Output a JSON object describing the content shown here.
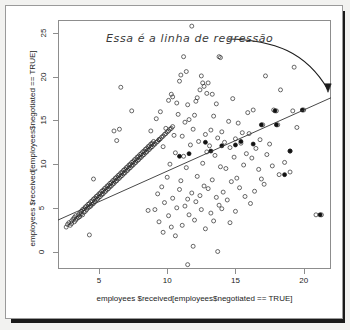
{
  "figure": {
    "annotation": "Essa é a linha de regressão",
    "background": "#ffffff",
    "frame_color": "#8d8d8d"
  },
  "chart_data": {
    "type": "scatter",
    "title": "",
    "xlabel": "employees $received[employees$negotiated == TRUE]",
    "ylabel": "employees $received[employees$negotiated == TRUE]",
    "xlim": [
      2.0,
      22.0
    ],
    "ylim": [
      -2.0,
      26.5
    ],
    "xticks": [
      5,
      10,
      15,
      20
    ],
    "yticks": [
      0,
      5,
      10,
      15,
      20,
      25
    ],
    "grid": false,
    "legend": null,
    "marker": "open-circle",
    "regression_line": {
      "label": "Essa é a linha de regressão",
      "x_start": 2.0,
      "y_start": 3.6,
      "x_end": 22.0,
      "y_end": 17.6,
      "slope": 0.7,
      "intercept": 2.2,
      "color": "#333333"
    },
    "points": [
      [
        2.6,
        2.8
      ],
      [
        2.7,
        3.1
      ],
      [
        2.8,
        3.3
      ],
      [
        2.9,
        3.0
      ],
      [
        3.0,
        3.5
      ],
      [
        3.0,
        3.2
      ],
      [
        3.1,
        3.7
      ],
      [
        3.2,
        3.4
      ],
      [
        3.2,
        3.9
      ],
      [
        3.3,
        3.6
      ],
      [
        3.3,
        4.1
      ],
      [
        3.4,
        3.8
      ],
      [
        3.5,
        4.2
      ],
      [
        3.5,
        3.9
      ],
      [
        3.6,
        4.4
      ],
      [
        3.6,
        4.0
      ],
      [
        3.7,
        4.3
      ],
      [
        3.7,
        4.6
      ],
      [
        3.8,
        4.2
      ],
      [
        3.8,
        4.8
      ],
      [
        3.9,
        4.5
      ],
      [
        3.9,
        4.9
      ],
      [
        4.0,
        4.6
      ],
      [
        4.0,
        5.1
      ],
      [
        4.1,
        4.8
      ],
      [
        4.1,
        5.2
      ],
      [
        4.2,
        5.0
      ],
      [
        4.2,
        5.4
      ],
      [
        4.3,
        5.1
      ],
      [
        4.3,
        5.5
      ],
      [
        4.4,
        5.2
      ],
      [
        4.4,
        5.7
      ],
      [
        4.5,
        5.4
      ],
      [
        4.5,
        5.8
      ],
      [
        4.6,
        5.5
      ],
      [
        4.6,
        6.0
      ],
      [
        4.7,
        5.7
      ],
      [
        4.7,
        6.1
      ],
      [
        4.8,
        5.9
      ],
      [
        4.8,
        6.3
      ],
      [
        4.9,
        6.0
      ],
      [
        4.9,
        6.4
      ],
      [
        5.0,
        6.2
      ],
      [
        5.0,
        6.6
      ],
      [
        5.1,
        6.3
      ],
      [
        5.1,
        6.7
      ],
      [
        5.2,
        6.5
      ],
      [
        5.2,
        6.9
      ],
      [
        5.3,
        6.6
      ],
      [
        5.3,
        7.0
      ],
      [
        5.4,
        6.8
      ],
      [
        5.4,
        7.2
      ],
      [
        5.5,
        6.9
      ],
      [
        5.5,
        7.3
      ],
      [
        5.6,
        7.1
      ],
      [
        5.6,
        7.5
      ],
      [
        5.7,
        7.2
      ],
      [
        5.7,
        7.6
      ],
      [
        5.8,
        7.4
      ],
      [
        5.8,
        7.8
      ],
      [
        5.9,
        7.5
      ],
      [
        5.9,
        7.9
      ],
      [
        6.0,
        7.7
      ],
      [
        6.0,
        8.1
      ],
      [
        6.1,
        7.8
      ],
      [
        6.1,
        8.2
      ],
      [
        6.2,
        8.0
      ],
      [
        6.2,
        8.4
      ],
      [
        6.3,
        8.1
      ],
      [
        6.3,
        8.5
      ],
      [
        6.4,
        8.3
      ],
      [
        6.4,
        8.7
      ],
      [
        6.5,
        8.4
      ],
      [
        6.5,
        8.8
      ],
      [
        6.6,
        8.6
      ],
      [
        6.6,
        9.0
      ],
      [
        6.7,
        8.7
      ],
      [
        6.7,
        9.1
      ],
      [
        6.8,
        8.9
      ],
      [
        6.8,
        9.3
      ],
      [
        6.9,
        9.0
      ],
      [
        6.9,
        9.4
      ],
      [
        7.0,
        9.2
      ],
      [
        7.0,
        9.6
      ],
      [
        7.1,
        9.3
      ],
      [
        7.1,
        9.7
      ],
      [
        7.2,
        9.5
      ],
      [
        7.2,
        9.9
      ],
      [
        7.3,
        9.6
      ],
      [
        7.3,
        10.0
      ],
      [
        7.4,
        9.8
      ],
      [
        7.4,
        10.2
      ],
      [
        7.5,
        9.9
      ],
      [
        7.5,
        10.3
      ],
      [
        7.6,
        10.1
      ],
      [
        7.6,
        10.5
      ],
      [
        7.7,
        10.2
      ],
      [
        7.7,
        10.6
      ],
      [
        7.8,
        10.4
      ],
      [
        7.8,
        10.8
      ],
      [
        7.9,
        10.5
      ],
      [
        7.9,
        10.9
      ],
      [
        8.0,
        10.7
      ],
      [
        8.0,
        11.1
      ],
      [
        8.1,
        10.8
      ],
      [
        8.1,
        11.2
      ],
      [
        8.2,
        11.0
      ],
      [
        8.2,
        11.4
      ],
      [
        8.3,
        11.1
      ],
      [
        8.3,
        11.5
      ],
      [
        8.4,
        11.3
      ],
      [
        8.4,
        11.7
      ],
      [
        8.5,
        11.4
      ],
      [
        8.5,
        11.8
      ],
      [
        8.6,
        11.6
      ],
      [
        8.6,
        12.0
      ],
      [
        8.7,
        11.7
      ],
      [
        8.7,
        12.1
      ],
      [
        8.8,
        11.9
      ],
      [
        8.8,
        12.3
      ],
      [
        8.9,
        12.0
      ],
      [
        8.9,
        12.4
      ],
      [
        9.0,
        12.2
      ],
      [
        9.0,
        12.6
      ],
      [
        9.1,
        12.3
      ],
      [
        9.2,
        12.5
      ],
      [
        9.3,
        12.6
      ],
      [
        9.4,
        12.8
      ],
      [
        9.5,
        12.9
      ],
      [
        9.6,
        13.1
      ],
      [
        9.7,
        13.2
      ],
      [
        9.8,
        13.4
      ],
      [
        9.9,
        13.5
      ],
      [
        10.0,
        13.7
      ],
      [
        10.1,
        13.8
      ],
      [
        10.2,
        14.0
      ],
      [
        10.3,
        14.1
      ],
      [
        10.4,
        14.3
      ],
      [
        11.8,
        25.8
      ],
      [
        11.2,
        22.3
      ],
      [
        13.8,
        22.3
      ],
      [
        13.9,
        22.2
      ],
      [
        11.4,
        20.6
      ],
      [
        11.0,
        20.2
      ],
      [
        12.5,
        20.1
      ],
      [
        19.3,
        21.1
      ],
      [
        17.2,
        20.1
      ],
      [
        10.9,
        19.5
      ],
      [
        12.6,
        19.3
      ],
      [
        13.0,
        19.3
      ],
      [
        12.7,
        18.9
      ],
      [
        6.6,
        18.8
      ],
      [
        12.4,
        18.5
      ],
      [
        12.9,
        18.1
      ],
      [
        10.3,
        18.0
      ],
      [
        13.3,
        18.0
      ],
      [
        10.4,
        17.7
      ],
      [
        12.2,
        17.6
      ],
      [
        14.8,
        17.5
      ],
      [
        18.3,
        18.5
      ],
      [
        10.1,
        17.3
      ],
      [
        12.1,
        17.2
      ],
      [
        10.7,
        17.0
      ],
      [
        13.6,
        16.9
      ],
      [
        11.5,
        16.8
      ],
      [
        16.3,
        16.2
      ],
      [
        17.8,
        16.2
      ],
      [
        20.0,
        16.2
      ],
      [
        19.2,
        16.1
      ],
      [
        18.0,
        16.1
      ],
      [
        7.4,
        16.1
      ],
      [
        9.5,
        16.0
      ],
      [
        15.9,
        15.9
      ],
      [
        10.8,
        15.7
      ],
      [
        12.0,
        15.6
      ],
      [
        13.4,
        15.5
      ],
      [
        9.2,
        15.2
      ],
      [
        11.6,
        15.1
      ],
      [
        14.5,
        14.9
      ],
      [
        11.3,
        14.8
      ],
      [
        15.2,
        14.7
      ],
      [
        17.0,
        14.5
      ],
      [
        18.1,
        14.5
      ],
      [
        19.5,
        14.2
      ],
      [
        9.9,
        14.1
      ],
      [
        11.9,
        14.0
      ],
      [
        13.2,
        13.9
      ],
      [
        8.8,
        13.8
      ],
      [
        6.1,
        13.8
      ],
      [
        6.5,
        14.0
      ],
      [
        14.0,
        13.7
      ],
      [
        15.5,
        13.6
      ],
      [
        16.0,
        13.5
      ],
      [
        12.8,
        13.4
      ],
      [
        10.5,
        13.3
      ],
      [
        11.1,
        13.2
      ],
      [
        13.7,
        13.0
      ],
      [
        15.0,
        12.9
      ],
      [
        16.8,
        12.8
      ],
      [
        9.4,
        12.8
      ],
      [
        6.3,
        12.7
      ],
      [
        12.3,
        12.6
      ],
      [
        14.2,
        12.5
      ],
      [
        15.4,
        12.4
      ],
      [
        17.5,
        12.3
      ],
      [
        11.7,
        12.2
      ],
      [
        13.1,
        12.1
      ],
      [
        9.7,
        12.0
      ],
      [
        14.6,
        11.9
      ],
      [
        16.5,
        11.8
      ],
      [
        19.0,
        11.5
      ],
      [
        12.9,
        11.4
      ],
      [
        10.6,
        11.3
      ],
      [
        15.8,
        11.2
      ],
      [
        17.3,
        11.1
      ],
      [
        13.5,
        11.0
      ],
      [
        11.2,
        10.9
      ],
      [
        14.9,
        10.8
      ],
      [
        16.2,
        10.7
      ],
      [
        18.6,
        10.2
      ],
      [
        12.6,
        10.1
      ],
      [
        10.2,
        10.0
      ],
      [
        15.6,
        9.9
      ],
      [
        17.7,
        9.8
      ],
      [
        13.9,
        9.7
      ],
      [
        11.4,
        9.6
      ],
      [
        14.3,
        9.5
      ],
      [
        16.7,
        9.4
      ],
      [
        19.0,
        9.1
      ],
      [
        18.2,
        8.8
      ],
      [
        12.2,
        8.6
      ],
      [
        10.0,
        8.5
      ],
      [
        15.1,
        8.4
      ],
      [
        16.9,
        8.3
      ],
      [
        13.3,
        8.2
      ],
      [
        11.0,
        8.1
      ],
      [
        14.7,
        8.0
      ],
      [
        4.6,
        8.3
      ],
      [
        17.1,
        7.7
      ],
      [
        12.7,
        7.5
      ],
      [
        9.6,
        7.4
      ],
      [
        15.3,
        7.3
      ],
      [
        13.0,
        7.2
      ],
      [
        10.9,
        7.1
      ],
      [
        16.4,
        6.9
      ],
      [
        14.1,
        6.8
      ],
      [
        11.8,
        6.7
      ],
      [
        9.3,
        6.6
      ],
      [
        12.4,
        6.4
      ],
      [
        15.7,
        6.3
      ],
      [
        13.6,
        6.2
      ],
      [
        10.4,
        6.1
      ],
      [
        11.5,
        6.0
      ],
      [
        14.4,
        5.9
      ],
      [
        12.1,
        5.7
      ],
      [
        9.8,
        5.6
      ],
      [
        16.1,
        5.5
      ],
      [
        13.8,
        5.3
      ],
      [
        11.3,
        5.2
      ],
      [
        10.7,
        5.0
      ],
      [
        14.0,
        4.9
      ],
      [
        12.5,
        4.8
      ],
      [
        9.1,
        4.8
      ],
      [
        8.6,
        4.7
      ],
      [
        15.0,
        4.6
      ],
      [
        13.2,
        4.4
      ],
      [
        11.6,
        4.2
      ],
      [
        10.1,
        4.1
      ],
      [
        21.3,
        4.2
      ],
      [
        20.9,
        4.2
      ],
      [
        12.0,
        3.6
      ],
      [
        13.4,
        3.5
      ],
      [
        9.4,
        3.4
      ],
      [
        14.6,
        3.3
      ],
      [
        11.1,
        3.0
      ],
      [
        10.3,
        2.8
      ],
      [
        12.8,
        2.6
      ],
      [
        9.7,
        2.2
      ],
      [
        10.6,
        1.8
      ],
      [
        4.3,
        1.9
      ],
      [
        11.9,
        0.6
      ],
      [
        13.7,
        0.0
      ],
      [
        11.5,
        -1.5
      ]
    ],
    "filled_points": [
      [
        16.9,
        14.5
      ],
      [
        18.0,
        14.5
      ],
      [
        19.9,
        16.2
      ],
      [
        17.9,
        16.1
      ],
      [
        15.4,
        12.6
      ],
      [
        16.3,
        12.3
      ],
      [
        14.0,
        12.1
      ],
      [
        12.8,
        12.5
      ],
      [
        11.6,
        11.2
      ],
      [
        10.9,
        10.9
      ],
      [
        19.0,
        11.5
      ],
      [
        18.6,
        8.8
      ],
      [
        21.2,
        4.2
      ],
      [
        13.2,
        11.5
      ],
      [
        15.0,
        12.2
      ]
    ]
  }
}
